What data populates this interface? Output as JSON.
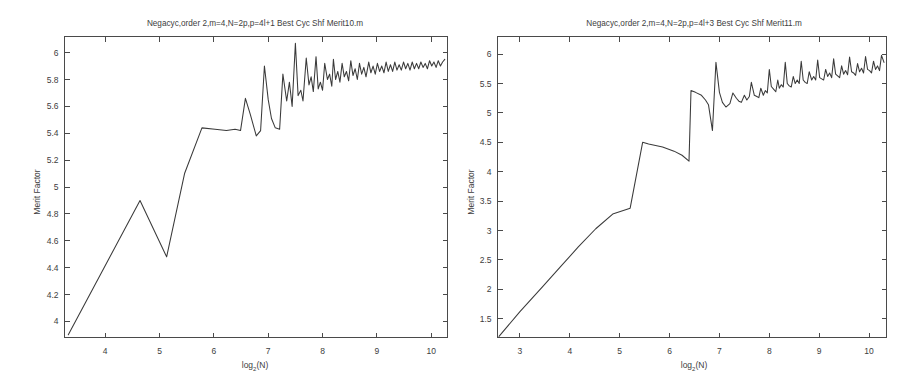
{
  "figure": {
    "background_color": "#ffffff",
    "line_color": "#3a3a3a",
    "axis_color": "#4a4a4a",
    "panel_count": 2
  },
  "chart_data": [
    {
      "type": "line",
      "panel": "left",
      "title": "Negacyc,order 2,m=4,N=2p,p=4l+1 Best Cyc Shf   Merit10.m",
      "xlabel": "log",
      "xlabel_sub": "2",
      "xlabel_tail": "(N)",
      "ylabel": "Merit Factor",
      "xlim": [
        3.25,
        10.3
      ],
      "ylim": [
        3.88,
        6.12
      ],
      "xticks": [
        4,
        5,
        6,
        7,
        8,
        9,
        10
      ],
      "xticklabels": [
        "4",
        "5",
        "6",
        "7",
        "8",
        "9",
        "10"
      ],
      "yticks": [
        4,
        4.2,
        4.4,
        4.6,
        4.8,
        5,
        5.2,
        5.4,
        5.6,
        5.8,
        6
      ],
      "yticklabels": [
        "4",
        "4.2",
        "4.4",
        "4.6",
        "4.8",
        "5",
        "5.2",
        "5.4",
        "5.6",
        "5.8",
        "6"
      ],
      "grid": false,
      "legend": false,
      "x": [
        3.32,
        4.64,
        5.13,
        5.46,
        5.78,
        6.02,
        6.23,
        6.39,
        6.49,
        6.58,
        6.67,
        6.78,
        6.86,
        6.93,
        7.0,
        7.06,
        7.13,
        7.21,
        7.27,
        7.34,
        7.39,
        7.44,
        7.5,
        7.55,
        7.6,
        7.64,
        7.7,
        7.75,
        7.79,
        7.83,
        7.88,
        7.92,
        7.96,
        8.0,
        8.04,
        8.09,
        8.13,
        8.17,
        8.2,
        8.24,
        8.28,
        8.32,
        8.36,
        8.4,
        8.44,
        8.48,
        8.52,
        8.56,
        8.6,
        8.64,
        8.68,
        8.72,
        8.76,
        8.8,
        8.85,
        8.89,
        8.93,
        8.97,
        9.01,
        9.05,
        9.09,
        9.13,
        9.17,
        9.21,
        9.25,
        9.29,
        9.33,
        9.37,
        9.41,
        9.45,
        9.49,
        9.53,
        9.57,
        9.61,
        9.65,
        9.69,
        9.73,
        9.77,
        9.81,
        9.85,
        9.89,
        9.93,
        9.97,
        10.01,
        10.05,
        10.09,
        10.13,
        10.17,
        10.21,
        10.25
      ],
      "y": [
        3.9,
        4.9,
        4.48,
        5.1,
        5.44,
        5.43,
        5.42,
        5.43,
        5.42,
        5.66,
        5.54,
        5.38,
        5.42,
        5.9,
        5.65,
        5.51,
        5.44,
        5.43,
        5.84,
        5.64,
        5.78,
        5.6,
        6.07,
        5.68,
        5.72,
        5.64,
        5.96,
        5.76,
        5.82,
        5.71,
        5.97,
        5.73,
        5.78,
        5.72,
        5.92,
        5.8,
        5.84,
        5.75,
        5.95,
        5.8,
        5.86,
        5.78,
        5.92,
        5.82,
        5.86,
        5.79,
        5.94,
        5.83,
        5.88,
        5.8,
        5.92,
        5.84,
        5.89,
        5.82,
        5.93,
        5.85,
        5.9,
        5.84,
        5.92,
        5.86,
        5.9,
        5.85,
        5.93,
        5.86,
        5.91,
        5.86,
        5.93,
        5.87,
        5.91,
        5.87,
        5.93,
        5.88,
        5.92,
        5.87,
        5.93,
        5.88,
        5.92,
        5.88,
        5.93,
        5.89,
        5.92,
        5.88,
        5.94,
        5.9,
        5.93,
        5.89,
        5.94,
        5.9,
        5.93,
        5.95
      ]
    },
    {
      "type": "line",
      "panel": "right",
      "title": "Negacyc,order 2,m=4,N=2p,p=4l+3 Best Cyc Shf   Merit11.m",
      "xlabel": "log",
      "xlabel_sub": "2",
      "xlabel_tail": "(N)",
      "ylabel": "Merit Factor",
      "xlim": [
        2.55,
        10.35
      ],
      "ylim": [
        1.18,
        6.3
      ],
      "xticks": [
        3,
        4,
        5,
        6,
        7,
        8,
        9,
        10
      ],
      "xticklabels": [
        "3",
        "4",
        "5",
        "6",
        "7",
        "8",
        "9",
        "10"
      ],
      "yticks": [
        1.5,
        2,
        2.5,
        3,
        3.5,
        4,
        4.5,
        5,
        5.5,
        6
      ],
      "yticklabels": [
        "1.5",
        "2",
        "2.5",
        "3",
        "3.5",
        "4",
        "4.5",
        "5",
        "5.5",
        "6"
      ],
      "grid": false,
      "legend": false,
      "x": [
        2.58,
        3.0,
        3.46,
        3.81,
        4.17,
        4.52,
        4.86,
        5.21,
        5.46,
        5.58,
        5.86,
        6.09,
        6.25,
        6.39,
        6.43,
        6.52,
        6.64,
        6.72,
        6.78,
        6.86,
        6.93,
        7.0,
        7.06,
        7.13,
        7.21,
        7.27,
        7.34,
        7.39,
        7.44,
        7.5,
        7.55,
        7.6,
        7.64,
        7.7,
        7.75,
        7.79,
        7.83,
        7.88,
        7.92,
        7.96,
        8.0,
        8.04,
        8.09,
        8.13,
        8.17,
        8.2,
        8.24,
        8.28,
        8.32,
        8.36,
        8.4,
        8.44,
        8.48,
        8.52,
        8.56,
        8.6,
        8.64,
        8.68,
        8.72,
        8.76,
        8.8,
        8.85,
        8.89,
        8.93,
        8.97,
        9.01,
        9.05,
        9.09,
        9.13,
        9.17,
        9.21,
        9.25,
        9.29,
        9.33,
        9.37,
        9.41,
        9.45,
        9.49,
        9.53,
        9.57,
        9.61,
        9.65,
        9.69,
        9.73,
        9.77,
        9.81,
        9.85,
        9.89,
        9.93,
        9.97,
        10.01,
        10.05,
        10.09,
        10.13,
        10.17,
        10.21,
        10.25,
        10.3
      ],
      "y": [
        1.2,
        1.62,
        2.05,
        2.38,
        2.72,
        3.03,
        3.28,
        3.38,
        4.5,
        4.47,
        4.42,
        4.35,
        4.28,
        4.18,
        5.38,
        5.35,
        5.3,
        5.22,
        5.14,
        4.7,
        5.86,
        5.35,
        5.18,
        5.1,
        5.16,
        5.34,
        5.25,
        5.2,
        5.18,
        5.3,
        5.22,
        5.28,
        5.52,
        5.3,
        5.28,
        5.26,
        5.42,
        5.3,
        5.38,
        5.34,
        5.74,
        5.45,
        5.4,
        5.36,
        5.56,
        5.42,
        5.48,
        5.44,
        5.86,
        5.5,
        5.46,
        5.44,
        5.62,
        5.5,
        5.56,
        5.5,
        5.88,
        5.56,
        5.52,
        5.5,
        5.7,
        5.56,
        5.62,
        5.56,
        5.9,
        5.6,
        5.58,
        5.56,
        5.74,
        5.62,
        5.68,
        5.6,
        5.92,
        5.66,
        5.63,
        5.6,
        5.8,
        5.66,
        5.72,
        5.65,
        5.95,
        5.7,
        5.68,
        5.64,
        5.84,
        5.7,
        5.76,
        5.68,
        5.96,
        5.74,
        5.72,
        5.68,
        5.88,
        5.74,
        5.8,
        5.72,
        5.98,
        5.86
      ]
    }
  ]
}
